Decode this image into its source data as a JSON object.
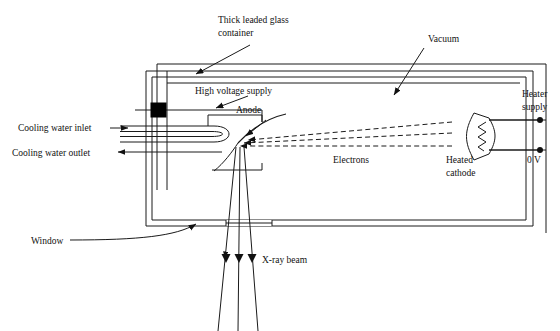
{
  "figure": {
    "type": "technical-diagram",
    "background": "#ffffff",
    "stroke": "#1a1a1a"
  },
  "labels": {
    "container_line1": "Thick leaded glass",
    "container_line2": "container",
    "vacuum": "Vacuum",
    "high_voltage": "High voltage supply",
    "anode": "Anode",
    "electrons": "Electrons",
    "heater_line1": "Heater",
    "heater_line2": "supply",
    "zero_volts": "0 V",
    "cathode_line1": "Heated",
    "cathode_line2": "cathode",
    "cooling_inlet": "Cooling water inlet",
    "cooling_outlet": "Cooling water outlet",
    "window": "Window",
    "xray_beam": "X-ray beam"
  },
  "components": {
    "insulator_block": {
      "name": "hv-insulator",
      "fill": "#000000"
    },
    "cathode_cup": {
      "name": "focusing-cup",
      "filament": "zigzag"
    },
    "terminals": [
      {
        "name": "heater-supply-terminal",
        "label": "Heater supply"
      },
      {
        "name": "zero-volt-terminal",
        "label": "0 V"
      }
    ],
    "electron_beams": {
      "count": 3,
      "style": "dashed",
      "direction": "right-to-left"
    },
    "xray_beams": {
      "count": 3,
      "style": "solid",
      "direction": "downward-diverging"
    },
    "cooling_pipe": {
      "shape": "hairpin-u"
    }
  }
}
